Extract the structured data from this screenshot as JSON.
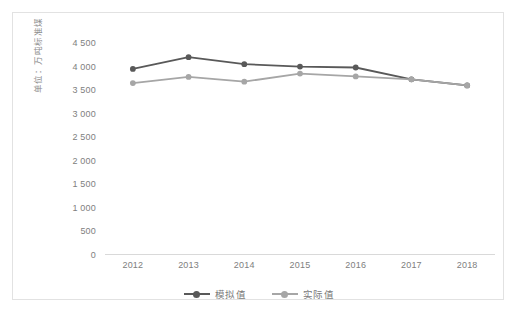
{
  "chart_data": {
    "type": "line",
    "title": "",
    "xlabel": "",
    "ylabel": "单位：万吨标准煤",
    "categories": [
      "2012",
      "2013",
      "2014",
      "2015",
      "2016",
      "2017",
      "2018"
    ],
    "ylim": [
      0,
      4500
    ],
    "ytick_labels": [
      "4 500",
      "4 000",
      "3 500",
      "3 000",
      "2 500",
      "2 000",
      "1 500",
      "1 000",
      "500",
      "0"
    ],
    "ytick_values": [
      4500,
      4000,
      3500,
      3000,
      2500,
      2000,
      1500,
      1000,
      500,
      0
    ],
    "grid": false,
    "legend_position": "bottom",
    "series": [
      {
        "name": "模拟值",
        "color": "#595959",
        "values": [
          3950,
          4200,
          4050,
          4000,
          3980,
          3730,
          3600
        ]
      },
      {
        "name": "实际值",
        "color": "#a6a6a6",
        "values": [
          3650,
          3780,
          3680,
          3850,
          3790,
          3730,
          3600
        ]
      }
    ]
  },
  "frame": {
    "border_color": "#e2e2e2",
    "background": "#ffffff"
  }
}
